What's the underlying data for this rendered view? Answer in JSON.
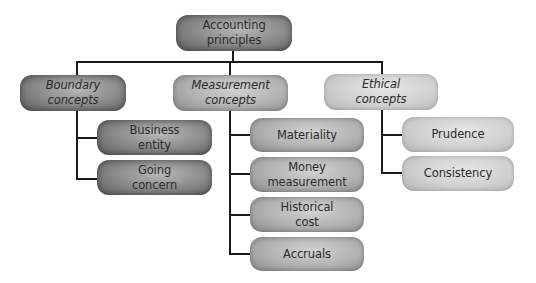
{
  "diagram": {
    "type": "hierarchy",
    "root": {
      "label": "Accounting principles",
      "line1": "Accounting",
      "line2": "principles"
    },
    "categories": [
      {
        "label": "Boundary concepts",
        "line1": "Boundary",
        "line2": "concepts",
        "children": [
          {
            "line1": "Business",
            "line2": "entity"
          },
          {
            "line1": "Going",
            "line2": "concern"
          }
        ]
      },
      {
        "label": "Measurement concepts",
        "line1": "Measurement",
        "line2": "concepts",
        "children": [
          {
            "line1": "Materiality",
            "line2": ""
          },
          {
            "line1": "Money",
            "line2": "measurement"
          },
          {
            "line1": "Historical",
            "line2": "cost"
          },
          {
            "line1": "Accruals",
            "line2": ""
          }
        ]
      },
      {
        "label": "Ethical concepts",
        "line1": "Ethical",
        "line2": "concepts",
        "children": [
          {
            "line1": "Prudence",
            "line2": ""
          },
          {
            "line1": "Consistency",
            "line2": ""
          }
        ]
      }
    ]
  }
}
